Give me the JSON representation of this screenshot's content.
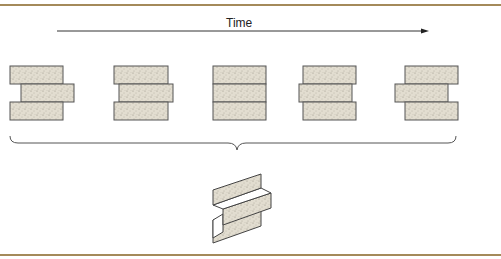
{
  "diagram": {
    "time_label": "Time",
    "colors": {
      "frame": "#a48a5a",
      "block_fill": "#e2ddd0",
      "block_stroke": "#555555",
      "speckle": "#8a8478",
      "line": "#333333"
    },
    "stages": [
      {
        "name": "stage-1",
        "top_offset": 0,
        "middle_offset": 11,
        "bottom_offset": 0
      },
      {
        "name": "stage-2",
        "top_offset": 0,
        "middle_offset": 5,
        "bottom_offset": 0
      },
      {
        "name": "stage-3",
        "top_offset": 0,
        "middle_offset": 0,
        "bottom_offset": 0
      },
      {
        "name": "stage-4",
        "top_offset": 0,
        "middle_offset": -4,
        "bottom_offset": 0
      },
      {
        "name": "stage-5",
        "top_offset": 0,
        "middle_offset": -10,
        "bottom_offset": 0
      }
    ],
    "summary_figure": "z-fold-sheet"
  }
}
